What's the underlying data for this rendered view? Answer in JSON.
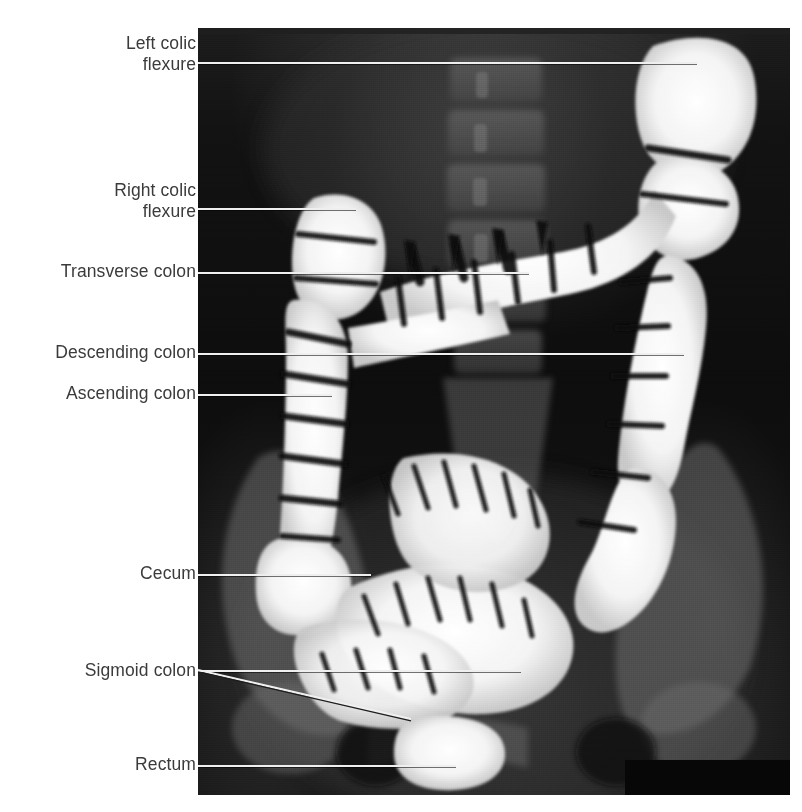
{
  "figure": {
    "kind": "barium-enema-radiograph",
    "modality": "double-contrast barium enema X-ray",
    "view": "anteroposterior abdominal",
    "background_color": "#ffffff",
    "label_color": "#3b3b3b",
    "leader_color": "#efefef",
    "image_region": {
      "x": 198,
      "y": 28,
      "width": 592,
      "height": 767
    }
  },
  "labels": [
    {
      "id": "left-colic-flexure",
      "text": "Left colic\nflexure",
      "label_x": 196,
      "label_y": 33,
      "leader": {
        "x1": 198,
        "y1": 62,
        "x2": 697,
        "y2": 62,
        "style": "light-to-dark"
      }
    },
    {
      "id": "right-colic-flexure",
      "text": "Right colic\nflexure",
      "label_x": 196,
      "label_y": 180,
      "leader": {
        "x1": 198,
        "y1": 208,
        "x2": 356,
        "y2": 208,
        "style": "light-to-dark"
      }
    },
    {
      "id": "transverse-colon",
      "text": "Transverse colon",
      "label_x": 196,
      "label_y": 261,
      "leader": {
        "x1": 198,
        "y1": 272,
        "x2": 529,
        "y2": 272,
        "style": "light-to-dark"
      }
    },
    {
      "id": "descending-colon",
      "text": "Descending colon",
      "label_x": 196,
      "label_y": 342,
      "leader": {
        "x1": 198,
        "y1": 353,
        "x2": 684,
        "y2": 353,
        "style": "light"
      }
    },
    {
      "id": "ascending-colon",
      "text": "Ascending colon",
      "label_x": 196,
      "label_y": 383,
      "leader": {
        "x1": 198,
        "y1": 394,
        "x2": 332,
        "y2": 394,
        "style": "light-to-dark"
      }
    },
    {
      "id": "cecum",
      "text": "Cecum",
      "label_x": 196,
      "label_y": 563,
      "leader": {
        "x1": 198,
        "y1": 574,
        "x2": 371,
        "y2": 574,
        "style": "light-to-dark"
      }
    },
    {
      "id": "sigmoid-colon",
      "text": "Sigmoid colon",
      "label_x": 196,
      "label_y": 660,
      "leader": {
        "x1": 198,
        "y1": 670,
        "x2": 521,
        "y2": 670,
        "style": "light-to-dark"
      },
      "leader2": {
        "x1": 198,
        "y1": 670,
        "x2": 411,
        "y2": 719,
        "style": "sloped"
      }
    },
    {
      "id": "rectum",
      "text": "Rectum",
      "label_x": 196,
      "label_y": 754,
      "leader": {
        "x1": 198,
        "y1": 765,
        "x2": 456,
        "y2": 765,
        "style": "light-to-dark"
      }
    }
  ],
  "anatomy_notes": {
    "contrast_agent": "barium sulfate (white)",
    "visible_structures": [
      "left colic (splenic) flexure",
      "right colic (hepatic) flexure",
      "transverse colon with haustra",
      "descending colon",
      "ascending colon",
      "cecum",
      "sigmoid colon loops",
      "rectum",
      "lumbar vertebrae",
      "iliac bones"
    ]
  }
}
